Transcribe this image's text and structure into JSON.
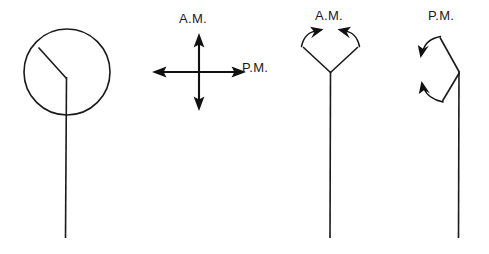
{
  "figure": {
    "background_color": "#ffffff",
    "ink_color": "#1a1a1a",
    "width": 489,
    "height": 254,
    "labels": {
      "am_cross": "A.M.",
      "pm_cross": "P.M.",
      "am_v": "A.M.",
      "pm_v": "P.M."
    },
    "panels": [
      {
        "name": "circle-with-angle-and-stem",
        "description": "Circle containing a bent line from upper-left rim to center, with a vertical stem descending below the circle"
      },
      {
        "name": "four-way-arrow-cross",
        "description": "Vertical and horizontal double-headed arrows crossing at center, labeled A.M. above and P.M. at right"
      },
      {
        "name": "v-up-with-inward-arrows",
        "description": "Upward opening V on a vertical stem with two curved arrows on the arms pointing up and inward, labeled A.M."
      },
      {
        "name": "v-right-with-downward-arrows",
        "description": "Rightward pointing V on a vertical stem with two curved arrows on the left arms, labeled P.M."
      }
    ]
  }
}
